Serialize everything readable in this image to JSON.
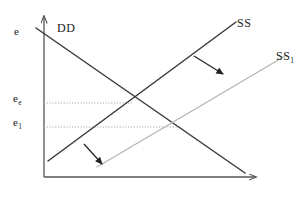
{
  "figure": {
    "background_color": "#ffffff",
    "axes": {
      "y_axis_label": "e",
      "y_axis_color": "#555555",
      "x_axis_color": "#555555",
      "origin": [
        44,
        177
      ],
      "y_axis_top": [
        44,
        14
      ],
      "x_axis_right": [
        258,
        177
      ]
    },
    "labels": {
      "vertical_axis": "e",
      "equilibrium_rate": "e",
      "equilibrium_rate_sub": "e",
      "rate_one": "e",
      "rate_one_sub": "1",
      "demand_curve": "DD",
      "supply_curve": "SS",
      "supply_curve_shifted": "SS",
      "supply_curve_shifted_sub": "1"
    },
    "curves": [
      {
        "name": "DD",
        "type": "demand",
        "color": "#3a3a3a",
        "width": 1.4,
        "from": [
          36,
          28
        ],
        "to": [
          245,
          173
        ],
        "label": "DD"
      },
      {
        "name": "SS",
        "type": "supply",
        "color": "#3a3a3a",
        "width": 1.4,
        "from": [
          48,
          161
        ],
        "to": [
          235,
          22
        ],
        "label": "SS"
      },
      {
        "name": "SS1",
        "type": "supply-shifted",
        "color": "#b0b0b0",
        "width": 1.2,
        "from": [
          98,
          166
        ],
        "to": [
          284,
          57
        ],
        "label": "SS1"
      }
    ],
    "gridlines": [
      {
        "name": "e_e-dotted",
        "color": "#aaaaaa",
        "y": 103,
        "from_x": 44,
        "to_x": 132
      },
      {
        "name": "e_1-dotted",
        "color": "#aaaaaa",
        "y": 127,
        "from_x": 44,
        "to_x": 180
      }
    ],
    "shift_arrows": [
      {
        "name": "upper-shift-arrow",
        "color": "#222222",
        "from": [
          194,
          56
        ],
        "to": [
          226,
          77
        ]
      },
      {
        "name": "lower-shift-arrow",
        "color": "#222222",
        "from": [
          84,
          144
        ],
        "to": [
          105,
          167
        ]
      }
    ]
  }
}
